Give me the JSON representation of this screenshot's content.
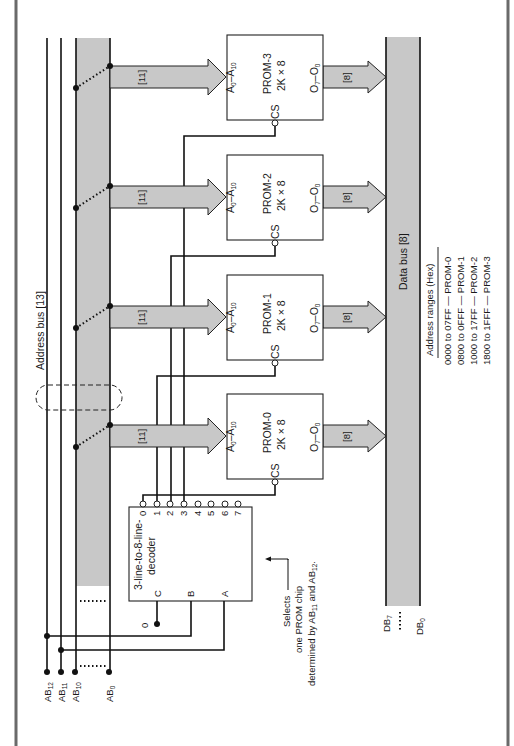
{
  "diagram": {
    "address_bus": {
      "label": "Address bus [13]",
      "lines": [
        {
          "name": "AB",
          "sub": "12"
        },
        {
          "name": "AB",
          "sub": "11"
        },
        {
          "name": "AB",
          "sub": "10"
        },
        {
          "name": "AB",
          "sub": "0"
        }
      ]
    },
    "data_bus": {
      "label": "Data bus [8]",
      "top": {
        "name": "DB",
        "sub": "7"
      },
      "bottom": {
        "name": "DB",
        "sub": "0"
      }
    },
    "proms": [
      {
        "name": "PROM-3",
        "size": "2K × 8",
        "addr_in": "A",
        "addr_in_sub0": "0",
        "addr_in_sub1": "10",
        "out": "O",
        "out_sub0": "7",
        "out_sub1": "0",
        "cs": "CS",
        "addr_width": "[11]",
        "data_width": "[8]"
      },
      {
        "name": "PROM-2",
        "size": "2K × 8",
        "addr_in": "A",
        "addr_in_sub0": "0",
        "addr_in_sub1": "10",
        "out": "O",
        "out_sub0": "7",
        "out_sub1": "0",
        "cs": "CS",
        "addr_width": "[11]",
        "data_width": "[8]"
      },
      {
        "name": "PROM-1",
        "size": "2K × 8",
        "addr_in": "A",
        "addr_in_sub0": "0",
        "addr_in_sub1": "10",
        "out": "O",
        "out_sub0": "7",
        "out_sub1": "0",
        "cs": "CS",
        "addr_width": "[11]",
        "data_width": "[8]"
      },
      {
        "name": "PROM-0",
        "size": "2K × 8",
        "addr_in": "A",
        "addr_in_sub0": "0",
        "addr_in_sub1": "10",
        "out": "O",
        "out_sub0": "7",
        "out_sub1": "0",
        "cs": "CS",
        "addr_width": "[11]",
        "data_width": "[8]"
      }
    ],
    "decoder": {
      "line1": "3-line-to-8-line-",
      "line2": "decoder",
      "inputs": [
        "C",
        "B",
        "A"
      ],
      "outputs": [
        "0",
        "1",
        "2",
        "3",
        "4",
        "5",
        "6",
        "7"
      ],
      "c_input_value": "0"
    },
    "annotation": {
      "line1": "Selects",
      "line2": "one PROM chip",
      "line3_pre": "determined by AB",
      "line3_sub1": "11",
      "line3_mid": " and AB",
      "line3_sub2": "12",
      "line3_end": "."
    },
    "address_ranges": {
      "title": "Address ranges (Hex)",
      "rows": [
        "0000 to 07FF — PROM-0",
        "0800 to 0FFF — PROM-1",
        "1000 to 17FF — PROM-2",
        "1800 to 1FFF — PROM-3"
      ]
    }
  }
}
